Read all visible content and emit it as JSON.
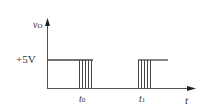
{
  "diagram": {
    "y_axis_label": "vO",
    "y_label_main": "v",
    "y_label_sub": "O",
    "x_axis_label": "t",
    "level_label": "+5V",
    "t0_label_main": "t",
    "t0_label_sub": "0",
    "t1_label_main": "t",
    "t1_label_sub": "1",
    "line_color": "#444444"
  }
}
